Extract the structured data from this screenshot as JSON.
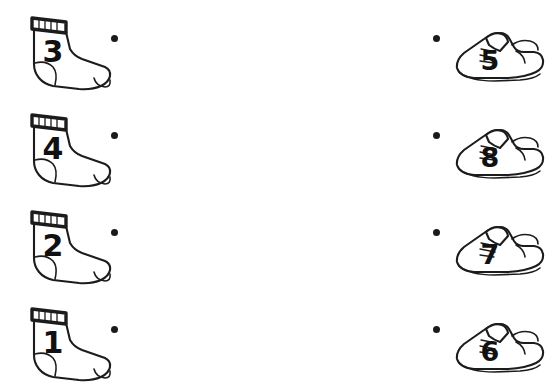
{
  "worksheet": {
    "title": "Matching worksheet: socks and shoes",
    "background_color": "#ffffff",
    "ink_color": "#1c1c1c",
    "numeral_color": "#111111",
    "dot_color": "#1a1a1a",
    "columns": {
      "left_label": "socks",
      "right_label": "shoes"
    },
    "rows": [
      {
        "sock": {
          "number": "3",
          "icon": "sock-icon"
        },
        "left_dot": {
          "icon": "connector-dot-icon"
        },
        "right_dot": {
          "icon": "connector-dot-icon"
        },
        "shoe": {
          "number": "5",
          "icon": "shoe-icon"
        }
      },
      {
        "sock": {
          "number": "4",
          "icon": "sock-icon"
        },
        "left_dot": {
          "icon": "connector-dot-icon"
        },
        "right_dot": {
          "icon": "connector-dot-icon"
        },
        "shoe": {
          "number": "8",
          "icon": "shoe-icon"
        }
      },
      {
        "sock": {
          "number": "2",
          "icon": "sock-icon"
        },
        "left_dot": {
          "icon": "connector-dot-icon"
        },
        "right_dot": {
          "icon": "connector-dot-icon"
        },
        "shoe": {
          "number": "7",
          "icon": "shoe-icon"
        }
      },
      {
        "sock": {
          "number": "1",
          "icon": "sock-icon"
        },
        "left_dot": {
          "icon": "connector-dot-icon"
        },
        "right_dot": {
          "icon": "connector-dot-icon"
        },
        "shoe": {
          "number": "6",
          "icon": "shoe-icon"
        }
      }
    ]
  }
}
